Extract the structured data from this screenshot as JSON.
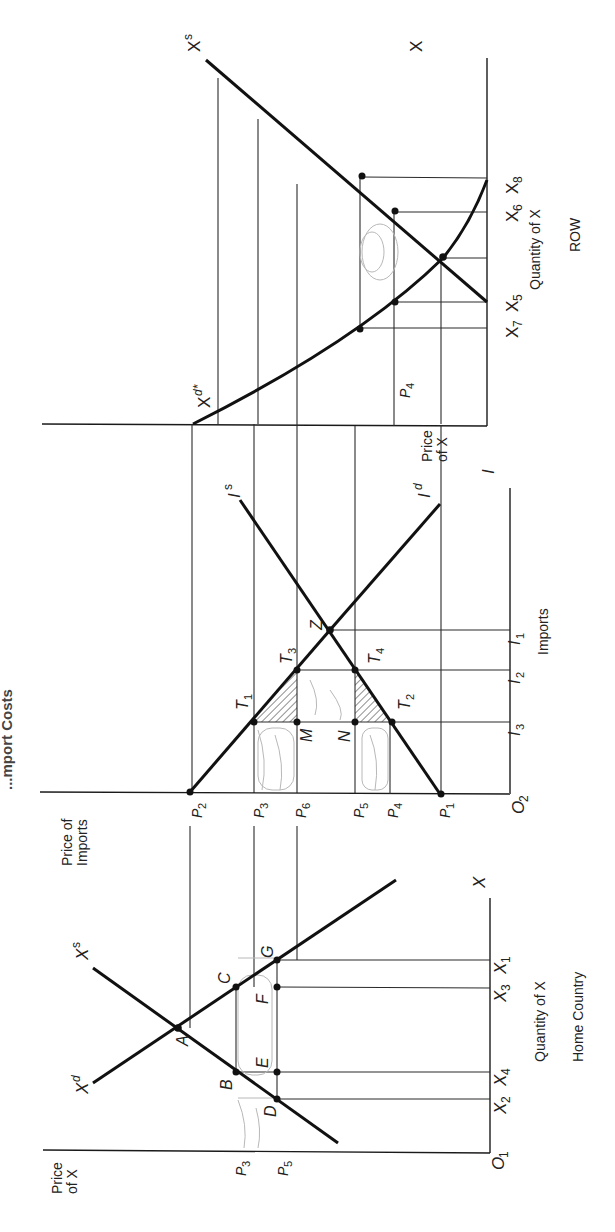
{
  "title_fragment": "...mport Costs",
  "panels": {
    "row": {
      "name": "ROW",
      "price_axis_label_1": "Price",
      "price_axis_label_2": "of X",
      "quantity_axis_label": "Quantity of X",
      "axis_end_label": "X",
      "supply_label": "X",
      "supply_sup": "s",
      "demand_label": "X",
      "demand_sup": "d*",
      "price_tick": "P",
      "price_tick_sub": "4",
      "qty_ticks": [
        {
          "base": "X",
          "sub": "8"
        },
        {
          "base": "X",
          "sub": "6"
        },
        {
          "base": "X",
          "sub": "5"
        },
        {
          "base": "X",
          "sub": "7"
        }
      ]
    },
    "imports": {
      "price_axis_label_1": "Price of",
      "price_axis_label_2": "Imports",
      "quantity_axis_label": "Imports",
      "axis_end_label": "I",
      "origin": {
        "base": "O",
        "sub": "2"
      },
      "supply_label": "I",
      "supply_sup": "s",
      "demand_label": "I",
      "demand_sup": "d",
      "price_ticks": [
        {
          "base": "P",
          "sub": "2"
        },
        {
          "base": "P",
          "sub": "3"
        },
        {
          "base": "P",
          "sub": "6"
        },
        {
          "base": "P",
          "sub": "5"
        },
        {
          "base": "P",
          "sub": "4"
        },
        {
          "base": "P",
          "sub": "1"
        }
      ],
      "qty_ticks": [
        {
          "base": "I",
          "sub": "1"
        },
        {
          "base": "I",
          "sub": "2"
        },
        {
          "base": "I",
          "sub": "3"
        }
      ],
      "points": [
        {
          "base": "T",
          "sub": "1"
        },
        {
          "base": "T",
          "sub": "2"
        },
        {
          "base": "T",
          "sub": "3"
        },
        {
          "base": "T",
          "sub": "4"
        },
        {
          "base": "Z",
          "sub": ""
        },
        {
          "base": "M",
          "sub": ""
        },
        {
          "base": "N",
          "sub": ""
        }
      ]
    },
    "home": {
      "name": "Home Country",
      "price_axis_label_1": "Price",
      "price_axis_label_2": "of X",
      "quantity_axis_label": "Quantity of X",
      "axis_end_label": "X",
      "origin": {
        "base": "O",
        "sub": "1"
      },
      "supply_label": "X",
      "supply_sup": "s",
      "demand_label": "X",
      "demand_sup": "d",
      "price_ticks": [
        {
          "base": "P",
          "sub": "3"
        },
        {
          "base": "P",
          "sub": "5"
        }
      ],
      "qty_ticks": [
        {
          "base": "X",
          "sub": "2"
        },
        {
          "base": "X",
          "sub": "4"
        },
        {
          "base": "X",
          "sub": "3"
        },
        {
          "base": "X",
          "sub": "1"
        }
      ],
      "points": [
        "A",
        "B",
        "C",
        "D",
        "E",
        "F",
        "G"
      ]
    }
  }
}
